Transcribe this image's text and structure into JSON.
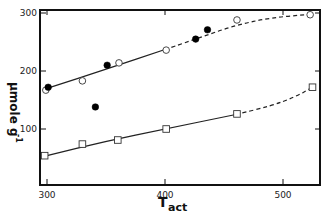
{
  "chart_data": {
    "type": "scatter",
    "title": "",
    "xlabel": "Tact",
    "xlabel_main": "T",
    "xlabel_sub": "act",
    "ylabel": "μmole g-1",
    "ylabel_main": "μmole g",
    "ylabel_sup": "-1",
    "xlim": [
      295,
      530
    ],
    "ylim": [
      25,
      305
    ],
    "x_ticks": [
      300,
      400,
      500
    ],
    "y_ticks": [
      100,
      200,
      300
    ],
    "x_tick_labels": [
      "300",
      "400",
      "500"
    ],
    "y_tick_labels": [
      "100",
      "200",
      "300"
    ],
    "grid": false,
    "legend": "none",
    "series": [
      {
        "name": "open circles",
        "marker": "open-circle",
        "points": [
          [
            299,
            167
          ],
          [
            330,
            183
          ],
          [
            361,
            214
          ],
          [
            401,
            236
          ],
          [
            461,
            288
          ],
          [
            523,
            297
          ]
        ]
      },
      {
        "name": "filled circles",
        "marker": "filled-circle",
        "points": [
          [
            301,
            172
          ],
          [
            341,
            138
          ],
          [
            351,
            210
          ],
          [
            426,
            255
          ],
          [
            436,
            271
          ]
        ]
      },
      {
        "name": "open squares",
        "marker": "open-square",
        "points": [
          [
            298,
            54
          ],
          [
            330,
            74
          ],
          [
            360,
            81
          ],
          [
            401,
            100
          ],
          [
            461,
            126
          ],
          [
            525,
            172
          ]
        ]
      }
    ],
    "fit_lines": [
      {
        "name": "upper curve solid",
        "style": "solid",
        "points": [
          [
            300,
            170
          ],
          [
            350,
            203
          ],
          [
            400,
            237
          ]
        ]
      },
      {
        "name": "upper curve dashed",
        "style": "dashed",
        "points": [
          [
            400,
            237
          ],
          [
            430,
            258
          ],
          [
            460,
            279
          ],
          [
            490,
            292
          ],
          [
            525,
            298
          ]
        ]
      },
      {
        "name": "lower curve solid",
        "style": "solid",
        "points": [
          [
            300,
            54
          ],
          [
            350,
            79
          ],
          [
            400,
            100
          ],
          [
            460,
            125
          ]
        ]
      },
      {
        "name": "lower curve dashed",
        "style": "dashed",
        "points": [
          [
            460,
            125
          ],
          [
            490,
            140
          ],
          [
            510,
            155
          ],
          [
            525,
            172
          ]
        ]
      }
    ],
    "colors": {
      "axis": "#111111",
      "line": "#222222",
      "marker_fill": "#000000",
      "background": "#ffffff"
    }
  }
}
